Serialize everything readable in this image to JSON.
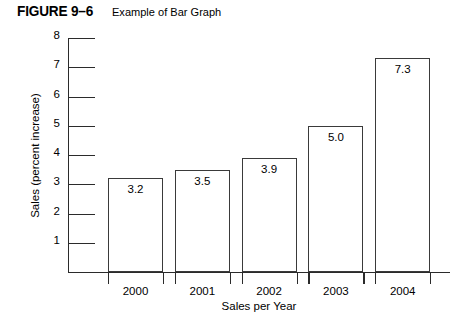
{
  "figure": {
    "number": "FIGURE 9–6",
    "title": "Example of Bar Graph"
  },
  "chart_data": {
    "type": "bar",
    "title": "Example of Bar Graph",
    "xlabel": "Sales per Year",
    "ylabel": "Sales (percent increase)",
    "categories": [
      "2000",
      "2001",
      "2002",
      "2003",
      "2004"
    ],
    "values": [
      3.2,
      3.5,
      3.9,
      5.0,
      7.3
    ],
    "value_labels": [
      "3.2",
      "3.5",
      "3.9",
      "5.0",
      "7.3"
    ],
    "ylim": [
      0,
      8
    ],
    "ytick_labels": [
      "8",
      "7",
      "6",
      "5",
      "4",
      "3",
      "2",
      "1"
    ],
    "ytick_values": [
      8,
      7,
      6,
      5,
      4,
      3,
      2,
      1
    ],
    "grid": false,
    "legend": false,
    "bar_face_color": "#ffffff",
    "bar_edge_color": "#3a3a3a",
    "axis_color": "#2b2b2b"
  }
}
